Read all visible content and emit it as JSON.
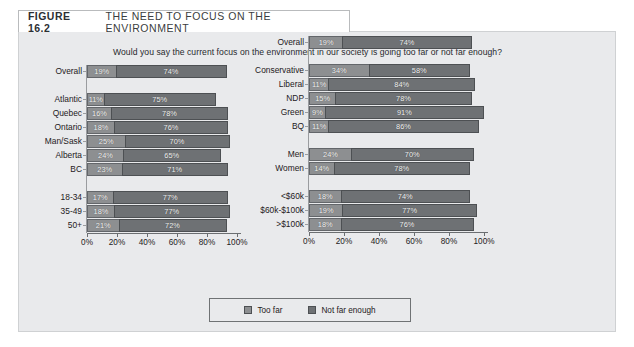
{
  "figure": {
    "number": "FIGURE 16.2",
    "title": "THE NEED TO FOCUS ON THE ENVIRONMENT",
    "question": "Would you say the current focus on the environment in our society is going too far or not far enough?"
  },
  "legend": {
    "items": [
      {
        "label": "Too far",
        "color": "#8d8f91"
      },
      {
        "label": "Not far enough",
        "color": "#6e7174"
      }
    ]
  },
  "axis": {
    "ticks": [
      "0%",
      "20%",
      "40%",
      "60%",
      "80%",
      "100%"
    ]
  },
  "chart_data": [
    {
      "type": "bar",
      "orientation": "horizontal",
      "stacked": true,
      "panel": "left",
      "title": "THE NEED TO FOCUS ON THE ENVIRONMENT",
      "subtitle": "Would you say the current focus on the environment in our society is going too far or not far enough?",
      "xlabel": "",
      "ylabel": "",
      "xlim": [
        0,
        100
      ],
      "xticks": [
        0,
        20,
        40,
        60,
        80,
        100
      ],
      "xticklabels": [
        "0%",
        "20%",
        "40%",
        "60%",
        "80%",
        "100%"
      ],
      "grid": false,
      "legend_position": "bottom-center",
      "series": [
        {
          "name": "Too far",
          "color": "#8d8f91",
          "values": [
            19,
            null,
            11,
            16,
            18,
            25,
            24,
            23,
            null,
            17,
            18,
            21
          ]
        },
        {
          "name": "Not far enough",
          "color": "#6e7174",
          "values": [
            74,
            null,
            75,
            78,
            76,
            70,
            65,
            71,
            null,
            77,
            77,
            72
          ]
        }
      ],
      "categories": [
        "Overall",
        "",
        "Atlantic",
        "Quebec",
        "Ontario",
        "Man/Sask",
        "Alberta",
        "BC",
        "",
        "18-34",
        "35-49",
        "50+"
      ],
      "rows": [
        {
          "label": "Overall",
          "too_far": 19,
          "too_far_label": "19%",
          "not_far": 74,
          "not_far_label": "74%"
        },
        {
          "label": "",
          "spacer": true
        },
        {
          "label": "Atlantic",
          "too_far": 11,
          "too_far_label": "11%",
          "not_far": 75,
          "not_far_label": "75%"
        },
        {
          "label": "Quebec",
          "too_far": 16,
          "too_far_label": "16%",
          "not_far": 78,
          "not_far_label": "78%"
        },
        {
          "label": "Ontario",
          "too_far": 18,
          "too_far_label": "18%",
          "not_far": 76,
          "not_far_label": "76%"
        },
        {
          "label": "Man/Sask",
          "too_far": 25,
          "too_far_label": "25%",
          "not_far": 70,
          "not_far_label": "70%"
        },
        {
          "label": "Alberta",
          "too_far": 24,
          "too_far_label": "24%",
          "not_far": 65,
          "not_far_label": "65%"
        },
        {
          "label": "BC",
          "too_far": 23,
          "too_far_label": "23%",
          "not_far": 71,
          "not_far_label": "71%"
        },
        {
          "label": "",
          "spacer": true
        },
        {
          "label": "18-34",
          "too_far": 17,
          "too_far_label": "17%",
          "not_far": 77,
          "not_far_label": "77%"
        },
        {
          "label": "35-49",
          "too_far": 18,
          "too_far_label": "18%",
          "not_far": 77,
          "not_far_label": "77%"
        },
        {
          "label": "50+",
          "too_far": 21,
          "too_far_label": "21%",
          "not_far": 72,
          "not_far_label": "72%"
        }
      ]
    },
    {
      "type": "bar",
      "orientation": "horizontal",
      "stacked": true,
      "panel": "right",
      "xlabel": "",
      "ylabel": "",
      "xlim": [
        0,
        100
      ],
      "xticks": [
        0,
        20,
        40,
        60,
        80,
        100
      ],
      "xticklabels": [
        "0%",
        "20%",
        "40%",
        "60%",
        "80%",
        "100%"
      ],
      "grid": false,
      "series": [
        {
          "name": "Too far",
          "color": "#8d8f91",
          "values": [
            19,
            null,
            34,
            11,
            15,
            9,
            11,
            null,
            24,
            14,
            null,
            18,
            19,
            18
          ]
        },
        {
          "name": "Not far enough",
          "color": "#6e7174",
          "values": [
            74,
            null,
            58,
            84,
            78,
            91,
            86,
            null,
            70,
            78,
            null,
            74,
            77,
            76
          ]
        }
      ],
      "categories": [
        "Overall",
        "",
        "Conservative",
        "Liberal",
        "NDP",
        "Green",
        "BQ",
        "",
        "Men",
        "Women",
        "",
        "<$60k",
        "$60k-$100k",
        ">$100k"
      ],
      "rows": [
        {
          "label": "Overall",
          "too_far": 19,
          "too_far_label": "19%",
          "not_far": 74,
          "not_far_label": "74%"
        },
        {
          "label": "",
          "spacer": true
        },
        {
          "label": "Conservative",
          "too_far": 34,
          "too_far_label": "34%",
          "not_far": 58,
          "not_far_label": "58%"
        },
        {
          "label": "Liberal",
          "too_far": 11,
          "too_far_label": "11%",
          "not_far": 84,
          "not_far_label": "84%"
        },
        {
          "label": "NDP",
          "too_far": 15,
          "too_far_label": "15%",
          "not_far": 78,
          "not_far_label": "78%"
        },
        {
          "label": "Green",
          "too_far": 9,
          "too_far_label": "9%",
          "not_far": 91,
          "not_far_label": "91%"
        },
        {
          "label": "BQ",
          "too_far": 11,
          "too_far_label": "11%",
          "not_far": 86,
          "not_far_label": "86%"
        },
        {
          "label": "",
          "spacer": true
        },
        {
          "label": "Men",
          "too_far": 24,
          "too_far_label": "24%",
          "not_far": 70,
          "not_far_label": "70%"
        },
        {
          "label": "Women",
          "too_far": 14,
          "too_far_label": "14%",
          "not_far": 78,
          "not_far_label": "78%"
        },
        {
          "label": "",
          "spacer": true
        },
        {
          "label": "<$60k",
          "too_far": 18,
          "too_far_label": "18%",
          "not_far": 74,
          "not_far_label": "74%"
        },
        {
          "label": "$60k-$100k",
          "too_far": 19,
          "too_far_label": "19%",
          "not_far": 77,
          "not_far_label": "77%"
        },
        {
          "label": ">$100k",
          "too_far": 18,
          "too_far_label": "18%",
          "not_far": 76,
          "not_far_label": "76%"
        }
      ]
    }
  ]
}
